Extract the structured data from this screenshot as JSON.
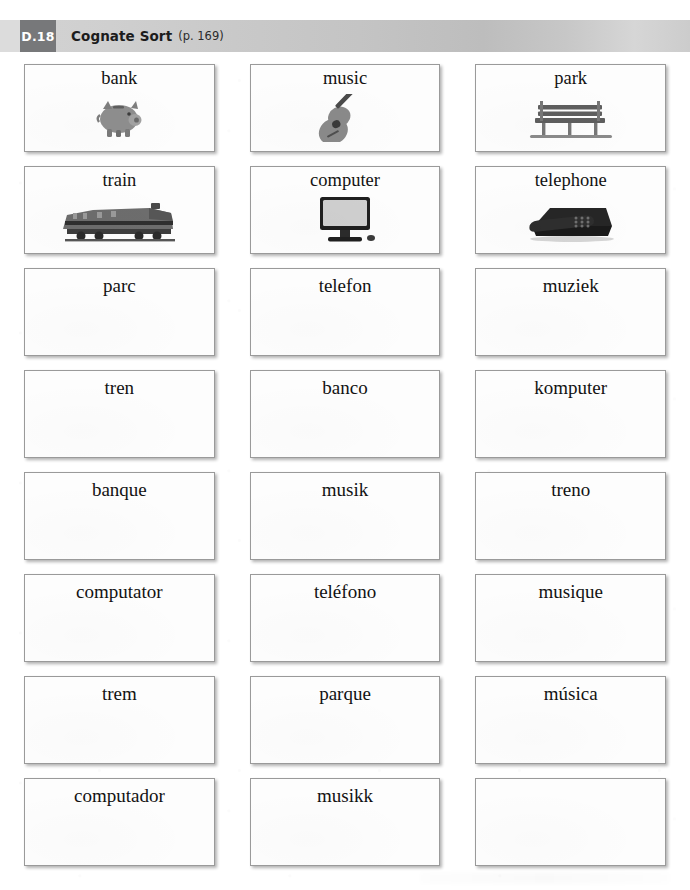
{
  "header": {
    "badge": "D.18",
    "title": "Cognate Sort",
    "page_ref": "(p. 169)",
    "badge_color": "#77787a",
    "bar_color": "#c7c7c7",
    "text_color": "#1c1c1c"
  },
  "cards": {
    "rows": [
      [
        {
          "label": "bank",
          "art": "piggy-bank",
          "blank": false
        },
        {
          "label": "music",
          "art": "guitar",
          "blank": false
        },
        {
          "label": "park",
          "art": "park-bench",
          "blank": false
        }
      ],
      [
        {
          "label": "train",
          "art": "locomotive",
          "blank": false
        },
        {
          "label": "computer",
          "art": "monitor",
          "blank": false
        },
        {
          "label": "telephone",
          "art": "telephone",
          "blank": false
        }
      ],
      [
        {
          "label": "parc",
          "art": null,
          "blank": false
        },
        {
          "label": "telefon",
          "art": null,
          "blank": false
        },
        {
          "label": "muziek",
          "art": null,
          "blank": false
        }
      ],
      [
        {
          "label": "tren",
          "art": null,
          "blank": false
        },
        {
          "label": "banco",
          "art": null,
          "blank": false
        },
        {
          "label": "komputer",
          "art": null,
          "blank": false
        }
      ],
      [
        {
          "label": "banque",
          "art": null,
          "blank": false
        },
        {
          "label": "musik",
          "art": null,
          "blank": false
        },
        {
          "label": "treno",
          "art": null,
          "blank": false
        }
      ],
      [
        {
          "label": "computator",
          "art": null,
          "blank": false
        },
        {
          "label": "teléfono",
          "art": null,
          "blank": false
        },
        {
          "label": "musique",
          "art": null,
          "blank": false
        }
      ],
      [
        {
          "label": "trem",
          "art": null,
          "blank": false
        },
        {
          "label": "parque",
          "art": null,
          "blank": false
        },
        {
          "label": "música",
          "art": null,
          "blank": false
        }
      ],
      [
        {
          "label": "computador",
          "art": null,
          "blank": false
        },
        {
          "label": "musikk",
          "art": null,
          "blank": false
        },
        {
          "label": "",
          "art": null,
          "blank": true
        }
      ]
    ]
  }
}
